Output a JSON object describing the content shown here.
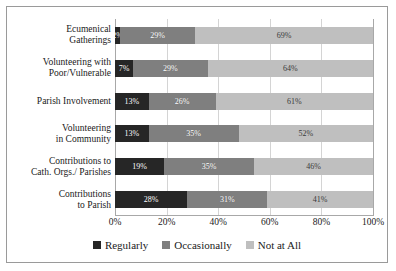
{
  "chart_data": {
    "type": "bar",
    "subtype": "stacked-horizontal-100pct",
    "title": "",
    "xlabel": "",
    "ylabel": "",
    "xlim": [
      0,
      100
    ],
    "xticks": [
      "0%",
      "20%",
      "40%",
      "60%",
      "80%",
      "100%"
    ],
    "xtick_values": [
      0,
      20,
      40,
      60,
      80,
      100
    ],
    "grid": true,
    "legend_position": "bottom-center",
    "categories": [
      "Ecumenical Gatherings",
      "Volunteering with Poor/Vulnerable",
      "Parish Involvement",
      "Volunteering in Community",
      "Contributions to Cath. Orgs./ Parishes",
      "Contributions to Parish"
    ],
    "category_lines": [
      [
        "Ecumenical",
        "Gatherings"
      ],
      [
        "Volunteering with",
        "Poor/Vulnerable"
      ],
      [
        "Parish Involvement"
      ],
      [
        "Volunteering",
        "in Community"
      ],
      [
        "Contributions to",
        "Cath. Orgs./ Parishes"
      ],
      [
        "Contributions",
        "to Parish"
      ]
    ],
    "series": [
      {
        "name": "Regularly",
        "color": "#262626",
        "values": [
          2,
          7,
          13,
          13,
          19,
          28
        ],
        "labels": [
          "2%",
          "7%",
          "13%",
          "13%",
          "19%",
          "28%"
        ]
      },
      {
        "name": "Occasionally",
        "color": "#7f7f7f",
        "values": [
          29,
          29,
          26,
          35,
          35,
          31
        ],
        "labels": [
          "29%",
          "29%",
          "26%",
          "35%",
          "35%",
          "31%"
        ]
      },
      {
        "name": "Not at All",
        "color": "#bfbfbf",
        "values": [
          69,
          64,
          61,
          52,
          46,
          41
        ],
        "labels": [
          "69%",
          "64%",
          "61%",
          "52%",
          "46%",
          "41%"
        ]
      }
    ]
  }
}
